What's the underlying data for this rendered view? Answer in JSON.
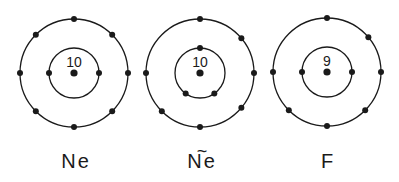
{
  "colors": {
    "ink": "#1a1a1a",
    "background": "#ffffff"
  },
  "atoms": [
    {
      "id": "ne",
      "label": "Ne",
      "label_tilde": "",
      "nucleus_charge": "10",
      "center": [
        74,
        73
      ],
      "inner_radius": 25,
      "outer_radius": 54,
      "inner_electrons_deg": [
        180,
        0
      ],
      "outer_electrons_deg": [
        90,
        45,
        0,
        -45,
        -90,
        -135,
        180,
        135
      ]
    },
    {
      "id": "ne-excited",
      "label": "Ne",
      "label_tilde": "~",
      "nucleus_charge": "10",
      "center": [
        200,
        73
      ],
      "inner_radius": 25,
      "outer_radius": 54,
      "inner_electrons_deg": [
        90,
        -125,
        -55
      ],
      "outer_electrons_deg": [
        90,
        40,
        0,
        -40,
        -90,
        -135,
        180
      ]
    },
    {
      "id": "f",
      "label": "F",
      "label_tilde": "",
      "nucleus_charge": "9",
      "center": [
        327,
        72
      ],
      "inner_radius": 25,
      "outer_radius": 54,
      "inner_electrons_deg": [
        180,
        0
      ],
      "outer_electrons_deg": [
        90,
        40,
        0,
        -45,
        -90,
        -135,
        180
      ]
    }
  ]
}
